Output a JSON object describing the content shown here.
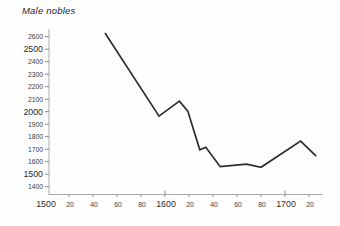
{
  "title": {
    "text": "Male nobles"
  },
  "colors": {
    "background": "#fefefe",
    "line": "#2d2d2d",
    "axis": "#ababab",
    "tick": "#8c8c8c",
    "label_minor": "#3c3c3c",
    "label_major": "#2a2a2a",
    "title": "#1e1e1e"
  },
  "chart_data": {
    "type": "line",
    "title": "Male nobles",
    "subtitle": "",
    "xlabel": "",
    "ylabel": "",
    "legend": null,
    "grid": false,
    "xlim": [
      1500,
      1730
    ],
    "ylim": [
      1400,
      2600
    ],
    "series": [
      {
        "name": "Male nobles",
        "x": [
          1550,
          1595,
          1612,
          1619,
          1629,
          1634,
          1646,
          1668,
          1680,
          1713,
          1726
        ],
        "values": [
          2630,
          1965,
          2085,
          2005,
          1695,
          1715,
          1560,
          1580,
          1555,
          1765,
          1645
        ]
      }
    ],
    "y_ticks": [
      1400,
      1500,
      1600,
      1700,
      1800,
      1900,
      2000,
      2100,
      2200,
      2300,
      2400,
      2500,
      2600
    ],
    "y_tick_labels": [
      "1400",
      "1500",
      "1600",
      "1700",
      "1800",
      "1900",
      "2000",
      "2100",
      "2200",
      "2300",
      "2400",
      "2500",
      "2600"
    ],
    "y_major_ticks": [
      1500,
      2000,
      2500
    ],
    "x_ticks": [
      1500,
      1520,
      1540,
      1560,
      1580,
      1600,
      1620,
      1640,
      1660,
      1680,
      1700,
      1720
    ],
    "x_tick_labels": [
      "1500",
      "20",
      "40",
      "60",
      "80",
      "1600",
      "20",
      "40",
      "60",
      "80",
      "1700",
      "20"
    ],
    "x_major_ticks": [
      1500,
      1600,
      1700
    ]
  }
}
